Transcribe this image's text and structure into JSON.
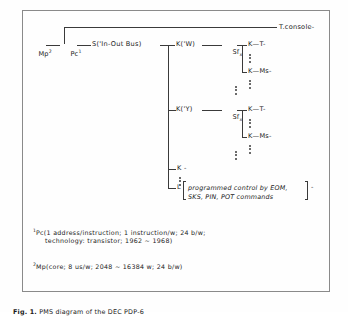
{
  "figure": {
    "caption_label": "Fig. 1.",
    "caption_text": "PMS diagram of the DEC PDP-6"
  },
  "diagram": {
    "nodes": {
      "mp": {
        "base": "Mp",
        "sup": "2"
      },
      "pc": {
        "base": "Pc",
        "sup": "1"
      },
      "switch": "S('In-Out Bus)",
      "t_console": "T.console-",
      "k_w": "K('W)",
      "sfx_1": {
        "base": "Sf",
        "sub": "x"
      },
      "k_t_1": "K—T-",
      "k_ms_1": "K—Ms-",
      "k_y": "K('Y)",
      "sfx_2": {
        "base": "Sf",
        "sub": "x"
      },
      "k_t_2": "K—T-",
      "k_ms_2": "K—Ms-",
      "k_plain": "K -",
      "l_node": "L",
      "dash_tail": "-"
    },
    "bracket_note": {
      "line1": "programmed control by EOM,",
      "line2": "SKS, PIN, POT commands"
    }
  },
  "footnotes": [
    {
      "marker": "1",
      "line1": "Pc(1 address/instruction; 1 instruction/w; 24 b/w;",
      "line2": "technology: transistor; 1962 ~ 1968)"
    },
    {
      "marker": "2",
      "line1": "Mp(core; 8 us/w; 2048 ~ 16384 w; 24 b/w)",
      "line2": ""
    }
  ],
  "colors": {
    "ink": "#222222",
    "line": "#3a3a3a",
    "frame": "#8a8a8a",
    "background": "#fefefe"
  }
}
